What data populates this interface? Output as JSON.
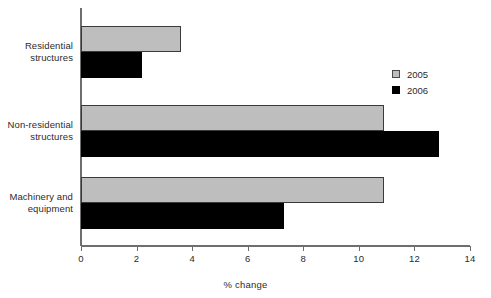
{
  "chart_data": {
    "type": "bar",
    "orientation": "horizontal",
    "title": "",
    "xlabel": "% change",
    "ylabel": "",
    "xlim": [
      0,
      14
    ],
    "xticks": [
      0,
      2,
      4,
      6,
      8,
      10,
      12,
      14
    ],
    "xtick_labels": [
      "0",
      "2",
      "4",
      "6",
      "8",
      "10",
      "12",
      "14"
    ],
    "grid": false,
    "legend_position": "right-upper",
    "categories": [
      "Residential structures",
      "Non-residential structures",
      "Machinery and equipment"
    ],
    "category_lines": [
      [
        "Residential",
        "structures"
      ],
      [
        "Non-residential",
        "structures"
      ],
      [
        "Machinery and",
        "equipment"
      ]
    ],
    "series": [
      {
        "name": "2005",
        "color": "#bebebe",
        "values": [
          3.6,
          10.9,
          10.9
        ]
      },
      {
        "name": "2006",
        "color": "#000000",
        "values": [
          2.2,
          12.9,
          7.3
        ]
      }
    ]
  },
  "legend": {
    "items": [
      {
        "label": "2005"
      },
      {
        "label": "2006"
      }
    ]
  },
  "axis": {
    "x_title": "% change",
    "ticks": [
      "0",
      "2",
      "4",
      "6",
      "8",
      "10",
      "12",
      "14"
    ]
  },
  "colors": {
    "series_2005": "#bebebe",
    "series_2006": "#000000",
    "axis": "#6e6e6e",
    "text": "#2b2b2b",
    "background": "#ffffff"
  }
}
